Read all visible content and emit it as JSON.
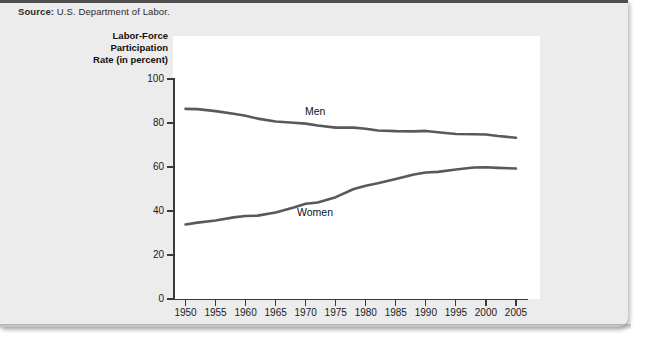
{
  "source": {
    "label": "Source:",
    "text": " U.S. Department of Labor."
  },
  "axis_title": {
    "line1": "Labor-Force",
    "line2": "Participation",
    "line3": "Rate (in percent)"
  },
  "colors": {
    "series_line": "#595959",
    "card_background": "#ececec",
    "plot_background": "#ffffff",
    "axis": "#3a3a3a"
  },
  "chart_data": {
    "type": "line",
    "title": "",
    "subtitle": "",
    "xlabel": "",
    "ylabel": "Labor-Force Participation Rate (in percent)",
    "xlim": [
      1948,
      2007
    ],
    "ylim": [
      0,
      100
    ],
    "xticks": [
      1950,
      1955,
      1960,
      1965,
      1970,
      1975,
      1980,
      1985,
      1990,
      1995,
      2000,
      2005
    ],
    "xtick_labels": [
      "1950",
      "1955",
      "1960",
      "1965",
      "1970",
      "1975",
      "1980",
      "1985",
      "1990",
      "1995",
      "2000",
      "2005"
    ],
    "yticks": [
      0,
      20,
      40,
      60,
      80,
      100
    ],
    "ytick_labels": [
      "0",
      "20",
      "40",
      "60",
      "80",
      "100"
    ],
    "grid": false,
    "legend": "inline-annotations",
    "x": [
      1950,
      1952,
      1955,
      1958,
      1960,
      1962,
      1965,
      1968,
      1970,
      1972,
      1975,
      1978,
      1980,
      1982,
      1985,
      1988,
      1990,
      1992,
      1995,
      1998,
      2000,
      2002,
      2005
    ],
    "series": [
      {
        "name": "Men",
        "label": "Men",
        "values": [
          86.4,
          86.3,
          85.4,
          84.2,
          83.3,
          82.0,
          80.7,
          80.1,
          79.7,
          78.9,
          77.9,
          77.9,
          77.4,
          76.6,
          76.3,
          76.2,
          76.4,
          75.8,
          75.0,
          74.9,
          74.8,
          74.1,
          73.3
        ]
      },
      {
        "name": "Women",
        "label": "Women",
        "values": [
          33.9,
          34.7,
          35.7,
          37.1,
          37.7,
          37.9,
          39.3,
          41.6,
          43.3,
          43.9,
          46.3,
          50.0,
          51.5,
          52.6,
          54.5,
          56.6,
          57.5,
          57.8,
          58.9,
          59.8,
          59.9,
          59.6,
          59.3
        ]
      }
    ]
  }
}
